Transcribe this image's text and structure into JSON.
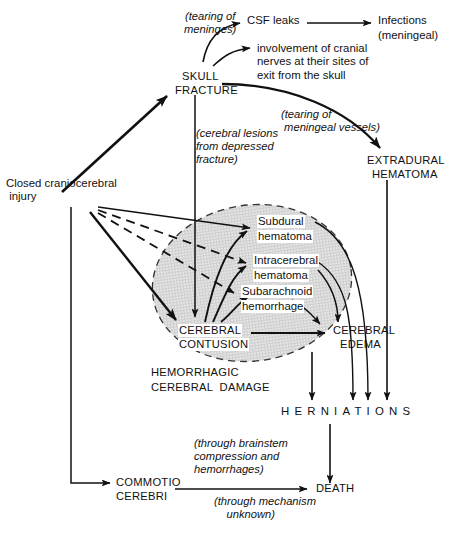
{
  "figure": {
    "type": "flow-diagram",
    "colors": {
      "ink": "#111111",
      "ellipse_fill": "#d9d9d9",
      "background": "#ffffff"
    }
  },
  "nodes": {
    "closed_injury": "Closed craniocerebral\n injury",
    "skull_fracture_line1": "SKULL",
    "skull_fracture_line2": "FRACTURE",
    "csf_leaks": "CSF leaks",
    "infections_line1": "Infections",
    "infections_line2": "(meningeal)",
    "cranial_nerves": "involvement of cranial\nnerves at their sites of\nexit from the skull",
    "extradural_line1": "EXTRADURAL",
    "extradural_line2": "HEMATOMA",
    "subdural_line1": "Subdural",
    "subdural_line2": "hematoma",
    "intracerebral_line1": "Intracerebral",
    "intracerebral_line2": "hematoma",
    "subarachnoid_line1": "Subarachnoid",
    "subarachnoid_line2": "hemorrhage",
    "cerebral_contusion_line1": "CEREBRAL",
    "cerebral_contusion_line2": "CONTUSION",
    "cerebral_edema_line1": "CEREBRAL",
    "cerebral_edema_line2": "EDEMA",
    "hemorrhagic_damage_line1": "HEMORRHAGIC",
    "hemorrhagic_damage_line2": "CEREBRAL  DAMAGE",
    "herniations": "HERNIATIONS",
    "commotio_line1": "COMMOTIO",
    "commotio_line2": "CEREBRI",
    "death": "DEATH"
  },
  "annotations": {
    "tearing_meninges": "(tearing of\nmeninges)",
    "tearing_meningeal_vessels": "(tearing of\n meningeal vessels)",
    "cerebral_lesions": "(cerebral lesions\nfrom depressed\nfracture)",
    "brainstem": "(through brainstem\ncompression and\nhemorrhages)",
    "mechanism_unknown": "(through mechanism\n    unknown)"
  }
}
